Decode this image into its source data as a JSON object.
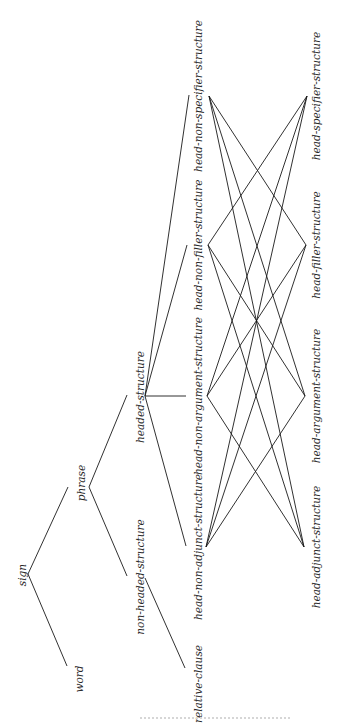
{
  "diagram": {
    "title": "",
    "orientation": "rotated-90",
    "line_color": "#1a1a1a",
    "label_color": "#2a2a2a",
    "nodes": [
      {
        "id": "sign",
        "label": "sign",
        "x": 28,
        "y": 575,
        "lx": 22,
        "ly": 575
      },
      {
        "id": "word",
        "label": "word",
        "x": 67,
        "y": 666,
        "lx": 79,
        "ly": 679
      },
      {
        "id": "phrase",
        "label": "phrase",
        "x": 89,
        "y": 487,
        "lx": 81,
        "ly": 483
      },
      {
        "id": "non-headed-structure",
        "label": "non-headed-structure",
        "x": 145,
        "y": 578,
        "lx": 140,
        "ly": 577
      },
      {
        "id": "headed-structure",
        "label": "headed-structure",
        "x": 145,
        "y": 396,
        "lx": 140,
        "ly": 397
      },
      {
        "id": "relative-clause",
        "label": "relative-clause",
        "x": 185,
        "y": 668,
        "lx": 198,
        "ly": 684
      },
      {
        "id": "head-non-adjunct-structure",
        "label": "head-non-adjunct-structure",
        "x": 206,
        "y": 547,
        "lx": 198,
        "ly": 547
      },
      {
        "id": "head-non-argument-structure",
        "label": "head-non-argument-structure",
        "x": 207,
        "y": 396,
        "lx": 198,
        "ly": 396
      },
      {
        "id": "head-non-filler-structure",
        "label": "head-non-filler-structure",
        "x": 208,
        "y": 245,
        "lx": 198,
        "ly": 245
      },
      {
        "id": "head-non-specifier-structure",
        "label": "head-non-specifier-structure",
        "x": 209,
        "y": 96,
        "lx": 198,
        "ly": 96
      },
      {
        "id": "head-adjunct-structure",
        "label": "head-adjunct-structure",
        "x": 304,
        "y": 547,
        "lx": 316,
        "ly": 547
      },
      {
        "id": "head-argument-structure",
        "label": "head-argument-structure",
        "x": 305,
        "y": 396,
        "lx": 316,
        "ly": 396
      },
      {
        "id": "head-filler-structure",
        "label": "head-filler-structure",
        "x": 306,
        "y": 245,
        "lx": 316,
        "ly": 245
      },
      {
        "id": "head-specifier-structure",
        "label": "head-specifier-structure",
        "x": 307,
        "y": 96,
        "lx": 316,
        "ly": 96
      }
    ],
    "edges": [
      {
        "from": [
          28,
          574
        ],
        "to": [
          68,
          487
        ]
      },
      {
        "from": [
          28,
          574
        ],
        "to": [
          67,
          666
        ]
      },
      {
        "from": [
          89,
          487
        ],
        "to": [
          127,
          395
        ]
      },
      {
        "from": [
          89,
          487
        ],
        "to": [
          127,
          576
        ]
      },
      {
        "from": [
          145,
          396
        ],
        "to": [
          189,
          95
        ]
      },
      {
        "from": [
          145,
          396
        ],
        "to": [
          187,
          245
        ]
      },
      {
        "from": [
          145,
          396
        ],
        "to": [
          186,
          396
        ]
      },
      {
        "from": [
          145,
          396
        ],
        "to": [
          186,
          546
        ]
      },
      {
        "from": [
          145,
          578
        ],
        "to": [
          185,
          668
        ]
      },
      {
        "from": [
          209,
          96
        ],
        "to": [
          306,
          245
        ]
      },
      {
        "from": [
          209,
          96
        ],
        "to": [
          305,
          396
        ]
      },
      {
        "from": [
          209,
          96
        ],
        "to": [
          304,
          547
        ]
      },
      {
        "from": [
          208,
          245
        ],
        "to": [
          307,
          96
        ]
      },
      {
        "from": [
          208,
          245
        ],
        "to": [
          305,
          396
        ]
      },
      {
        "from": [
          208,
          245
        ],
        "to": [
          304,
          547
        ]
      },
      {
        "from": [
          207,
          396
        ],
        "to": [
          307,
          96
        ]
      },
      {
        "from": [
          207,
          396
        ],
        "to": [
          306,
          245
        ]
      },
      {
        "from": [
          207,
          396
        ],
        "to": [
          304,
          547
        ]
      },
      {
        "from": [
          206,
          547
        ],
        "to": [
          307,
          96
        ]
      },
      {
        "from": [
          206,
          547
        ],
        "to": [
          306,
          245
        ]
      },
      {
        "from": [
          206,
          547
        ],
        "to": [
          305,
          396
        ]
      }
    ],
    "footer_bleed": {
      "x1": 140,
      "x2": 290,
      "y": 718
    }
  }
}
